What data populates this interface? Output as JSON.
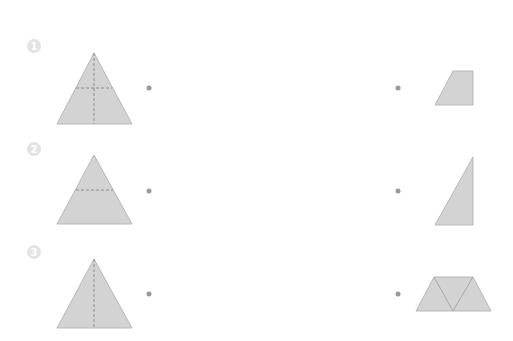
{
  "colors": {
    "shape_fill": "#d3d3d3",
    "shape_stroke": "#b8b8b8",
    "dashed_line": "#8c8c8c",
    "badge_fill": "#e3e3e3",
    "dot": "#9a9a9a"
  },
  "rows": [
    {
      "number": "1",
      "left_shape": "equilateral triangle with vertical and horizontal dashed fold lines",
      "right_shape": "right trapezoid"
    },
    {
      "number": "2",
      "left_shape": "equilateral triangle with horizontal dashed fold line",
      "right_shape": "right triangle"
    },
    {
      "number": "3",
      "left_shape": "equilateral triangle with vertical dashed fold line",
      "right_shape": "trapezoid made of three triangles"
    }
  ]
}
